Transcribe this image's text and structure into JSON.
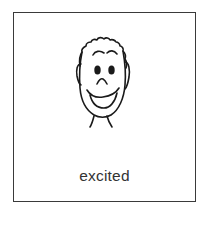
{
  "card": {
    "label": "excited",
    "icon": "excited-face-icon"
  },
  "colors": {
    "stroke": "#1a1a1a",
    "border": "#3a3a3a",
    "text": "#333333",
    "background": "#ffffff"
  }
}
